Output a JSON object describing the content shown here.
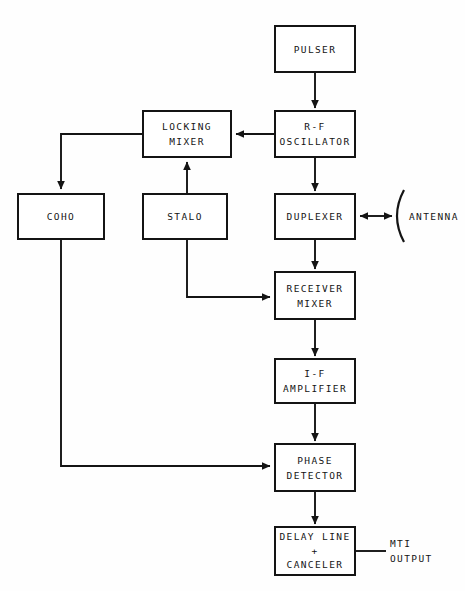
{
  "diagram": {
    "stroke_color": "#141414",
    "background_color": "#fefefe",
    "blocks": [
      {
        "id": "pulser",
        "lines": [
          "PULSER"
        ]
      },
      {
        "id": "rf_oscillator",
        "lines": [
          "R-F",
          "OSCILLATOR"
        ]
      },
      {
        "id": "locking_mixer",
        "lines": [
          "LOCKING",
          "MIXER"
        ]
      },
      {
        "id": "coho",
        "lines": [
          "COHO"
        ]
      },
      {
        "id": "stalo",
        "lines": [
          "STALO"
        ]
      },
      {
        "id": "duplexer",
        "lines": [
          "DUPLEXER"
        ]
      },
      {
        "id": "receiver_mixer",
        "lines": [
          "RECEIVER",
          "MIXER"
        ]
      },
      {
        "id": "if_amplifier",
        "lines": [
          "I-F",
          "AMPLIFIER"
        ]
      },
      {
        "id": "phase_detector",
        "lines": [
          "PHASE",
          "DETECTOR"
        ]
      },
      {
        "id": "delay_canceler",
        "lines": [
          "DELAY LINE",
          "+",
          "CANCELER"
        ]
      }
    ],
    "labels": {
      "antenna": "ANTENNA",
      "mti_output_line1": "MTI",
      "mti_output_line2": "OUTPUT"
    },
    "connections": [
      {
        "from": "pulser",
        "to": "rf_oscillator",
        "arrow": "single"
      },
      {
        "from": "rf_oscillator",
        "to": "locking_mixer",
        "arrow": "single"
      },
      {
        "from": "rf_oscillator",
        "to": "duplexer",
        "arrow": "single"
      },
      {
        "from": "stalo",
        "to": "locking_mixer",
        "arrow": "single"
      },
      {
        "from": "locking_mixer",
        "to": "coho",
        "arrow": "single"
      },
      {
        "from": "duplexer",
        "to": "antenna",
        "arrow": "double"
      },
      {
        "from": "duplexer",
        "to": "receiver_mixer",
        "arrow": "single"
      },
      {
        "from": "stalo",
        "to": "receiver_mixer",
        "arrow": "single"
      },
      {
        "from": "receiver_mixer",
        "to": "if_amplifier",
        "arrow": "single"
      },
      {
        "from": "if_amplifier",
        "to": "phase_detector",
        "arrow": "single"
      },
      {
        "from": "coho",
        "to": "phase_detector",
        "arrow": "single"
      },
      {
        "from": "phase_detector",
        "to": "delay_canceler",
        "arrow": "single"
      },
      {
        "from": "delay_canceler",
        "to": "mti_output",
        "arrow": "none"
      }
    ]
  }
}
